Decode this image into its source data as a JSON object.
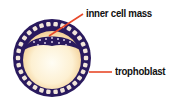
{
  "diagram": {
    "labels": [
      {
        "id": "icm",
        "text": "inner cell mass"
      },
      {
        "id": "tropho",
        "text": "trophoblast"
      }
    ],
    "colors": {
      "cell_layer": "#2a1a5e",
      "cell_dots": "#f2e6da",
      "cavity_center": "#fffdf4",
      "cavity_edge": "#f6d9a4",
      "leader_line": "#e8492a",
      "label_text": "#111111"
    }
  }
}
